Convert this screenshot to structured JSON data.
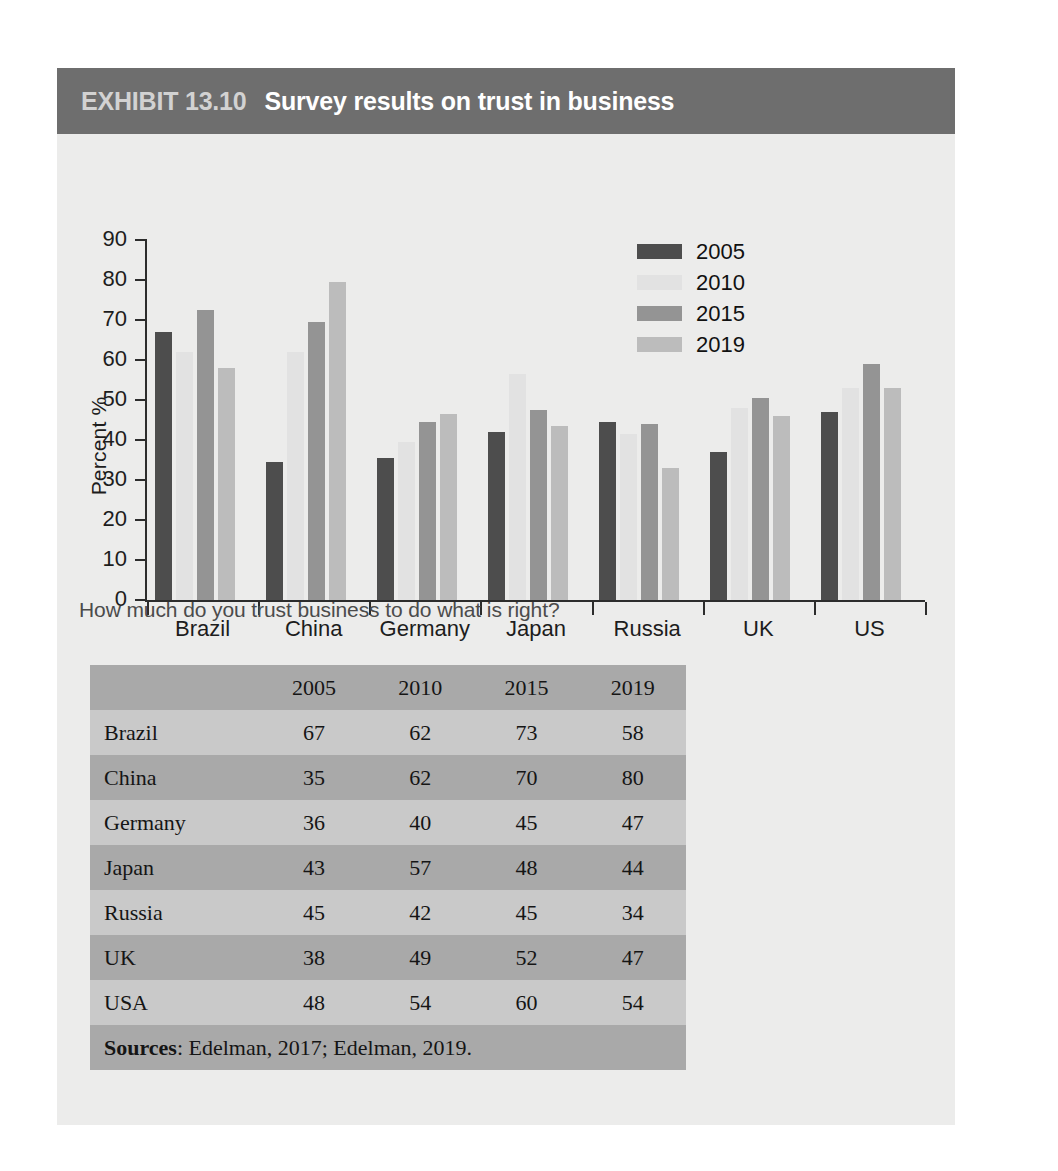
{
  "exhibit": {
    "label": "EXHIBIT 13.10",
    "title": "Survey results on trust in business",
    "caption": "How much do you trust business to do what is right?"
  },
  "colors": {
    "header_bar": "#6e6e6e",
    "card_bg": "#ececeb",
    "series_2005": "#4d4d4d",
    "series_2010": "#e2e2e2",
    "series_2015": "#949494",
    "series_2019": "#bcbcbc",
    "table_row_dark": "#a9a9a9",
    "table_row_light": "#c9c9c9"
  },
  "chart_data": {
    "type": "bar",
    "title": "Survey results on trust in business",
    "xlabel": "",
    "ylabel": "Percent %",
    "ylim": [
      0,
      90
    ],
    "ytick_labels": [
      "0",
      "10",
      "20",
      "30",
      "40",
      "50",
      "60",
      "70",
      "80",
      "90"
    ],
    "yticks": [
      0,
      10,
      20,
      30,
      40,
      50,
      60,
      70,
      80,
      90
    ],
    "grid": false,
    "legend_position": "top-right",
    "categories": [
      "Brazil",
      "China",
      "Germany",
      "Japan",
      "Russia",
      "UK",
      "US"
    ],
    "series": [
      {
        "name": "2005",
        "color": "#4d4d4d",
        "values": [
          67,
          34.5,
          35.5,
          42,
          44.5,
          37,
          47
        ]
      },
      {
        "name": "2010",
        "color": "#e2e2e2",
        "values": [
          62,
          62,
          39.5,
          56.5,
          41.5,
          48,
          53
        ]
      },
      {
        "name": "2015",
        "color": "#949494",
        "values": [
          72.5,
          69.5,
          44.5,
          47.5,
          44,
          50.5,
          59
        ]
      },
      {
        "name": "2019",
        "color": "#bcbcbc",
        "values": [
          58,
          79.5,
          46.5,
          43.5,
          33,
          46,
          53
        ]
      }
    ]
  },
  "table": {
    "headers": [
      "",
      "2005",
      "2010",
      "2015",
      "2019"
    ],
    "rows": [
      {
        "name": "Brazil",
        "values": [
          "67",
          "62",
          "73",
          "58"
        ]
      },
      {
        "name": "China",
        "values": [
          "35",
          "62",
          "70",
          "80"
        ]
      },
      {
        "name": "Germany",
        "values": [
          "36",
          "40",
          "45",
          "47"
        ]
      },
      {
        "name": "Japan",
        "values": [
          "43",
          "57",
          "48",
          "44"
        ]
      },
      {
        "name": "Russia",
        "values": [
          "45",
          "42",
          "45",
          "34"
        ]
      },
      {
        "name": "UK",
        "values": [
          "38",
          "49",
          "52",
          "47"
        ]
      },
      {
        "name": "USA",
        "values": [
          "48",
          "54",
          "60",
          "54"
        ]
      }
    ],
    "sources_label": "Sources",
    "sources_text": ": Edelman, 2017; Edelman, 2019."
  }
}
